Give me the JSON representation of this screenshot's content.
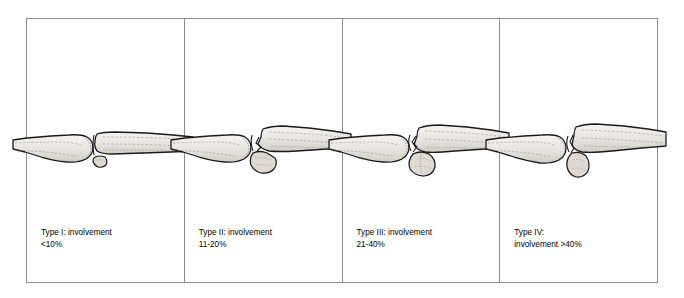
{
  "figure": {
    "frame_border_color": "#8c8c8c",
    "background_color": "#ffffff",
    "text_color": "#000000",
    "bone_outline_color": "#1a1a1a",
    "bone_fill_color": "#e8e6e2",
    "panels": [
      {
        "id": "type-1",
        "caption_line1": "Type I: involvement",
        "caption_line2": "<10%",
        "type_label": "Type I",
        "involvement": "<10%",
        "fragment_size": "small",
        "joint_congruent": true
      },
      {
        "id": "type-2",
        "caption_line1": "Type II: involvement",
        "caption_line2": "11-20%",
        "type_label": "Type II",
        "involvement": "11-20%",
        "fragment_size": "medium",
        "joint_congruent": false
      },
      {
        "id": "type-3",
        "caption_line1": "Type III: involvement",
        "caption_line2": "21-40%",
        "type_label": "Type III",
        "involvement": "21-40%",
        "fragment_size": "large",
        "joint_congruent": false
      },
      {
        "id": "type-4",
        "caption_line1": "Type IV:",
        "caption_line2": "involvement >40%",
        "type_label": "Type IV",
        "involvement": ">40%",
        "fragment_size": "very-large",
        "joint_congruent": false
      }
    ]
  }
}
